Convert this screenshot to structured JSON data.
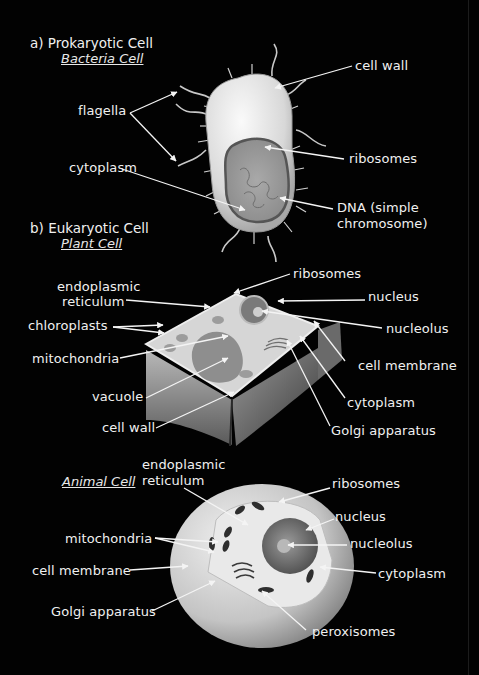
{
  "diagram": {
    "background_color": "#020202",
    "label_color": "#f0f0f0",
    "sections": [
      {
        "heading": "a) Prokaryotic Cell",
        "subheading": "Bacteria Cell",
        "labels": {
          "flagella": "flagella",
          "cell_wall": "cell wall",
          "ribosomes": "ribosomes",
          "cytoplasm": "cytoplasm",
          "dna_line1": "DNA (simple",
          "dna_line2": "chromosome)"
        }
      },
      {
        "heading": "b) Eukaryotic Cell",
        "subheading": "Plant Cell",
        "labels": {
          "er_line1": "endoplasmic",
          "er_line2": "reticulum",
          "chloroplasts": "chloroplasts",
          "mitochondria": "mitochondria",
          "vacuole": "vacuole",
          "cell_wall": "cell wall",
          "ribosomes": "ribosomes",
          "nucleus": "nucleus",
          "nucleolus": "nucleolus",
          "cell_membrane": "cell membrane",
          "cytoplasm": "cytoplasm",
          "golgi": "Golgi apparatus"
        }
      },
      {
        "subheading": "Animal Cell",
        "labels": {
          "er_line1": "endoplasmic",
          "er_line2": "reticulum",
          "mitochondria": "mitochondria",
          "cell_membrane": "cell membrane",
          "golgi": "Golgi apparatus",
          "ribosomes": "ribosomes",
          "nucleus": "nucleus",
          "nucleolus": "nucleolus",
          "cytoplasm": "cytoplasm",
          "peroxisomes": "peroxisomes"
        }
      }
    ]
  }
}
